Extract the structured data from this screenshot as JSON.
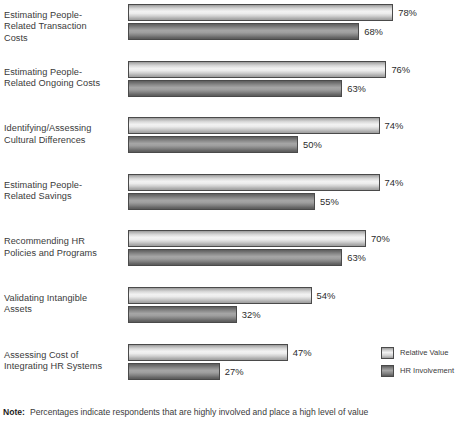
{
  "chart_data": {
    "type": "bar",
    "orientation": "horizontal",
    "title": "",
    "xlabel": "",
    "ylabel": "",
    "xlim": [
      0,
      100
    ],
    "grid": false,
    "legend_position": "bottom-right",
    "value_suffix": "%",
    "categories": [
      "Estimating People-Related Transaction Costs",
      "Estimating People-Related Ongoing Costs",
      "Identifying/Assessing Cultural Differences",
      "Estimating People-Related Savings",
      "Recommending HR Policies and Programs",
      "Validating Intangible Assets",
      "Assessing Cost of Integrating HR Systems"
    ],
    "category_lines": [
      [
        "Estimating People-",
        "Related Transaction",
        "Costs"
      ],
      [
        "Estimating People-",
        "Related Ongoing Costs"
      ],
      [
        "Identifying/Assessing",
        "Cultural Differences"
      ],
      [
        "Estimating People-",
        "Related Savings"
      ],
      [
        "Recommending HR",
        "Policies and Programs"
      ],
      [
        "Validating Intangible",
        "Assets"
      ],
      [
        "Assessing Cost of",
        "Integrating HR Systems"
      ]
    ],
    "series": [
      {
        "name": "Relative Value",
        "color": "#ededed",
        "values": [
          78,
          76,
          74,
          74,
          70,
          54,
          47
        ],
        "labels": [
          "78%",
          "76%",
          "74%",
          "74%",
          "70%",
          "54%",
          "47%"
        ]
      },
      {
        "name": "HR Involvement",
        "color": "#8b8b8b",
        "values": [
          68,
          63,
          50,
          55,
          63,
          32,
          27
        ],
        "labels": [
          "68%",
          "63%",
          "50%",
          "55%",
          "63%",
          "32%",
          "27%"
        ]
      }
    ]
  },
  "legend": {
    "items": [
      {
        "label": "Relative Value",
        "swatch": "light"
      },
      {
        "label": "HR Involvement",
        "swatch": "dark"
      }
    ]
  },
  "note": {
    "label": "Note:",
    "text": "Percentages indicate respondents that are highly involved and place a high level of value"
  }
}
